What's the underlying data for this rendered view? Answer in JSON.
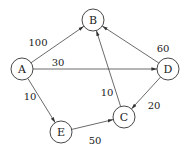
{
  "diagram": {
    "type": "weighted-directed-graph",
    "nodes": [
      {
        "id": "A",
        "label": "A",
        "x": 22,
        "y": 69
      },
      {
        "id": "B",
        "label": "B",
        "x": 93,
        "y": 20
      },
      {
        "id": "D",
        "label": "D",
        "x": 168,
        "y": 69
      },
      {
        "id": "C",
        "label": "C",
        "x": 124,
        "y": 117
      },
      {
        "id": "E",
        "label": "E",
        "x": 61,
        "y": 132
      }
    ],
    "edges": [
      {
        "from": "A",
        "to": "B",
        "weight": "100",
        "label_x": 38,
        "label_y": 42
      },
      {
        "from": "A",
        "to": "D",
        "weight": "30",
        "label_x": 58,
        "label_y": 62
      },
      {
        "from": "A",
        "to": "E",
        "weight": "10",
        "label_x": 30,
        "label_y": 96
      },
      {
        "from": "E",
        "to": "C",
        "weight": "50",
        "label_x": 95,
        "label_y": 140
      },
      {
        "from": "C",
        "to": "B",
        "weight": "10",
        "label_x": 107,
        "label_y": 92
      },
      {
        "from": "D",
        "to": "B",
        "weight": "60",
        "label_x": 163,
        "label_y": 48
      },
      {
        "from": "D",
        "to": "C",
        "weight": "20",
        "label_x": 154,
        "label_y": 105
      }
    ]
  }
}
